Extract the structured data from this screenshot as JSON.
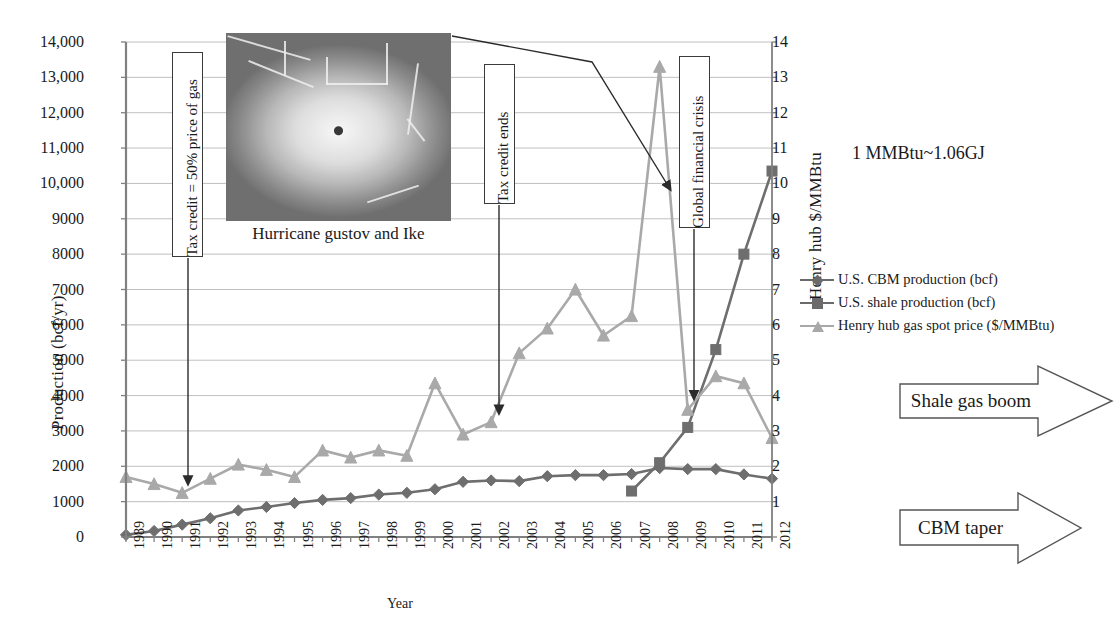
{
  "axes": {
    "y_left_title": "Production (bcf/yr)",
    "y_right_title": "Henry hub $/MMBtu",
    "x_title": "Year",
    "y_left_ticks": [
      "0",
      "1000",
      "2000",
      "3000",
      "4000",
      "5000",
      "6000",
      "7000",
      "8000",
      "9000",
      "10,000",
      "11,000",
      "12,000",
      "13,000",
      "14,000"
    ],
    "y_right_ticks": [
      "1",
      "2",
      "3",
      "4",
      "5",
      "6",
      "7",
      "8",
      "9",
      "10",
      "11",
      "12",
      "13",
      "14"
    ]
  },
  "annotations": {
    "tax_credit_start": "Tax credit = 50% price of gas",
    "tax_credit_ends": "Tax credit ends",
    "global_financial_crisis": "Global financial crisis",
    "hurricane_caption": "Hurricane gustov and Ike",
    "unit_note": "1 MMBtu~1.06GJ",
    "shale_boom": "Shale gas boom",
    "cbm_taper": "CBM  taper"
  },
  "legend": {
    "items": [
      {
        "label": "U.S. CBM production (bcf)",
        "marker": "diamond",
        "color": "#6b6b6b"
      },
      {
        "label": "U.S. shale production (bcf)",
        "marker": "square",
        "color": "#6b6b6b"
      },
      {
        "label": "Henry hub gas spot price ($/MMBtu)",
        "marker": "triangle",
        "color": "#a8a8a8"
      }
    ]
  },
  "colors": {
    "cbm": "#6e6e6e",
    "shale": "#6e6e6e",
    "price": "#a9a9a9",
    "axis": "#808080",
    "grid": "#b9b9b9",
    "annotation": "#2b2b2b"
  },
  "chart_data": {
    "type": "line",
    "title": "",
    "xlabel": "Year",
    "ylabel": "Production (bcf/yr)",
    "y2label": "Henry hub $/MMBtu",
    "ylim": [
      0,
      14000
    ],
    "y2lim": [
      0,
      14
    ],
    "grid": true,
    "legend_position": "right",
    "categories": [
      "1989",
      "1990",
      "1991",
      "1992",
      "1993",
      "1994",
      "1995",
      "1996",
      "1997",
      "1998",
      "1999",
      "2000",
      "2001",
      "2002",
      "2003",
      "2004",
      "2005",
      "2006",
      "2007",
      "2008",
      "2009",
      "2010",
      "2011",
      "2012"
    ],
    "series": [
      {
        "name": "U.S. CBM production (bcf)",
        "axis": "left",
        "unit": "bcf",
        "values": [
          60,
          170,
          350,
          530,
          750,
          850,
          960,
          1050,
          1100,
          1200,
          1250,
          1350,
          1560,
          1600,
          1580,
          1720,
          1750,
          1750,
          1780,
          1950,
          1920,
          1920,
          1770,
          1650
        ]
      },
      {
        "name": "U.S. shale production (bcf)",
        "axis": "left",
        "unit": "bcf",
        "values": [
          null,
          null,
          null,
          null,
          null,
          null,
          null,
          null,
          null,
          null,
          null,
          null,
          null,
          null,
          null,
          null,
          null,
          null,
          1300,
          2100,
          3100,
          5300,
          8000,
          10350
        ]
      },
      {
        "name": "Henry hub gas spot price ($/MMBtu)",
        "axis": "right",
        "unit": "$/MMBtu",
        "values": [
          1.7,
          1.5,
          1.25,
          1.65,
          2.05,
          1.9,
          1.7,
          2.45,
          2.25,
          2.45,
          2.3,
          4.35,
          2.9,
          3.25,
          5.2,
          5.9,
          7.0,
          5.7,
          6.25,
          13.3,
          3.6,
          4.55,
          4.35,
          2.8
        ]
      }
    ],
    "annotations": [
      {
        "text": "Tax credit = 50% price of gas",
        "points_to_year": "1991",
        "points_to_value": 1.25
      },
      {
        "text": "Tax credit ends",
        "points_to_year": "2002",
        "points_to_value": 3.25
      },
      {
        "text": "Global financial crisis",
        "points_to_year": "2009",
        "points_to_value": 3.6
      },
      {
        "text": "Hurricane gustov and Ike",
        "points_to_year": "2008",
        "points_to_value": 13.3
      }
    ]
  }
}
